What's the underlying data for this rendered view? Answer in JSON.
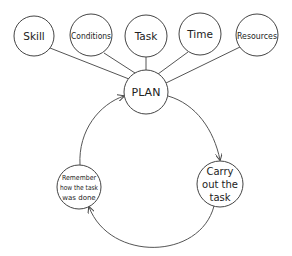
{
  "diagram": {
    "type": "concept-cycle",
    "top_nodes": [
      {
        "id": "skill",
        "label": "Skill",
        "cx": 34,
        "cy": 36,
        "r": 20
      },
      {
        "id": "conditions",
        "label": "Conditions",
        "cx": 91,
        "cy": 35,
        "r": 21
      },
      {
        "id": "task",
        "label": "Task",
        "cx": 146,
        "cy": 36,
        "r": 21
      },
      {
        "id": "time",
        "label": "Time",
        "cx": 200,
        "cy": 34,
        "r": 21
      },
      {
        "id": "resources",
        "label": "Resources",
        "cx": 257,
        "cy": 35,
        "r": 21
      }
    ],
    "center_node": {
      "id": "plan",
      "label": "PLAN",
      "cx": 146,
      "cy": 92,
      "r": 22
    },
    "cycle_nodes": [
      {
        "id": "carry",
        "lines": [
          "Carry",
          "out the",
          "task"
        ],
        "cx": 220,
        "cy": 184,
        "r": 23
      },
      {
        "id": "remember",
        "lines": [
          "Remember",
          "how the task",
          "was done"
        ],
        "cx": 79,
        "cy": 187,
        "r": 22
      }
    ],
    "edges": [
      {
        "from": "skill",
        "to": "plan",
        "style": "line"
      },
      {
        "from": "conditions",
        "to": "plan",
        "style": "line"
      },
      {
        "from": "task",
        "to": "plan",
        "style": "line"
      },
      {
        "from": "time",
        "to": "plan",
        "style": "line"
      },
      {
        "from": "resources",
        "to": "plan",
        "style": "line"
      },
      {
        "from": "plan",
        "to": "carry",
        "style": "curved-arrow"
      },
      {
        "from": "carry",
        "to": "remember",
        "style": "curved-arrow"
      },
      {
        "from": "remember",
        "to": "plan",
        "style": "curved-arrow"
      }
    ],
    "colors": {
      "stroke": "#444444",
      "text": "#222222",
      "background": "#ffffff"
    }
  }
}
